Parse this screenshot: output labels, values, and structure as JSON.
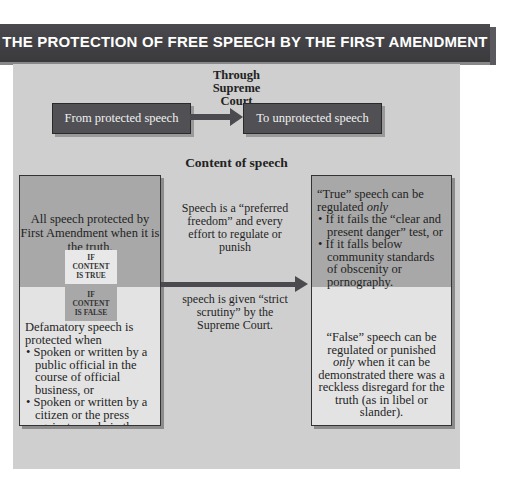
{
  "title": "THE PROTECTION OF FREE SPEECH BY THE FIRST AMENDMENT",
  "flow": {
    "connector_label": "Through Supreme Court",
    "connector_lines": [
      "Through",
      "Supreme",
      "Court"
    ],
    "from_label": "From protected speech",
    "to_label": "To unprotected speech"
  },
  "content_title": "Content of speech",
  "left_column": {
    "true_text": "All speech protected by First Amendment when it is the truth.",
    "badge_true": [
      "IF",
      "CONTENT",
      "IS TRUE"
    ],
    "badge_false": [
      "IF",
      "CONTENT",
      "IS FALSE"
    ],
    "false_intro": "Defamatory speech is protected when",
    "false_bullets": [
      "Spoken or written by a public official in the course of official business, or",
      "Spoken or written by a citizen or the press against people in the public eye."
    ]
  },
  "middle_column": {
    "upper_text": "Speech is a “preferred freedom” and every effort to regulate or punish",
    "lower_text": "speech is given “strict scrutiny” by the Supreme Court."
  },
  "right_column": {
    "true_intro": "“True” speech can be regulated",
    "true_intro_emphasis": "only",
    "true_bullets": [
      "If it fails the “clear and present danger” test, or",
      "If it falls below community standards of obscenity or pornography."
    ],
    "false_text_before": "“False” speech can be regulated or punished",
    "false_text_emphasis": "only",
    "false_text_after": "when it can be demonstrated there was a reckless disregard for the truth (as in libel or slander)."
  },
  "colors": {
    "title_bar": "#3f3f42",
    "panel": "#cfcfcf",
    "dark_box": "#505055",
    "true_area": "#a8a8a8",
    "false_area": "#e3e3e3"
  }
}
